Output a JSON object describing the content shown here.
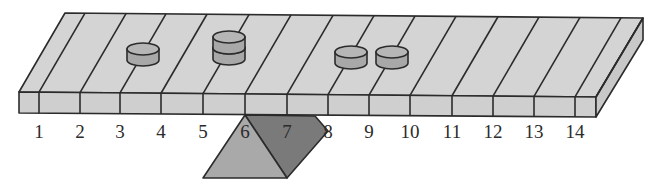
{
  "diagram": {
    "positions": [
      "1",
      "2",
      "3",
      "4",
      "5",
      "6",
      "7",
      "8",
      "9",
      "10",
      "11",
      "12",
      "13",
      "14"
    ],
    "weights": [
      {
        "position": 3,
        "count": 1
      },
      {
        "position": 5,
        "count": 2
      },
      {
        "position": 8,
        "count": 1
      },
      {
        "position": 9,
        "count": 1
      }
    ],
    "fulcrum": {
      "between_positions": [
        6,
        7
      ]
    },
    "colors": {
      "beam_top": "#d4d4d4",
      "beam_front": "#cfcfcf",
      "beam_side": "#c8c8c8",
      "weight": "#a8a8a8",
      "weight_top": "#b6b6b6",
      "fulcrum_light": "#a9a9a9",
      "fulcrum_dark": "#7a7a7a",
      "stroke": "#2b2b2b"
    }
  }
}
